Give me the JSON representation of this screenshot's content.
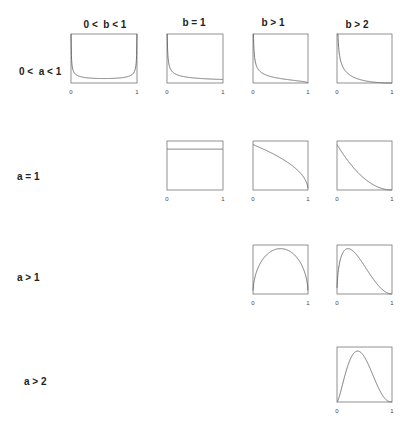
{
  "chart_data": {
    "type": "line",
    "title": "",
    "column_headers": [
      "0 <  b < 1",
      "b = 1",
      "b > 1",
      "b > 2"
    ],
    "row_headers": [
      "0 <  a < 1",
      "a = 1",
      "a > 1",
      "a > 2"
    ],
    "x_tick_labels": [
      "0",
      "1"
    ],
    "xlim": [
      0,
      1
    ],
    "grid": false,
    "panels": [
      {
        "row": 0,
        "col": 0,
        "a": 0.5,
        "b": 0.5,
        "shape": "U-shaped"
      },
      {
        "row": 0,
        "col": 1,
        "a": 0.5,
        "b": 1,
        "shape": "decreasing, asymptote at 0"
      },
      {
        "row": 0,
        "col": 2,
        "a": 0.5,
        "b": 1.5,
        "shape": "decreasing to 0"
      },
      {
        "row": 0,
        "col": 3,
        "a": 0.5,
        "b": 3,
        "shape": "decreasing, fast decay"
      },
      {
        "row": 1,
        "col": 1,
        "a": 1,
        "b": 1,
        "shape": "uniform"
      },
      {
        "row": 1,
        "col": 2,
        "a": 1,
        "b": 1.5,
        "shape": "concave decreasing"
      },
      {
        "row": 1,
        "col": 3,
        "a": 1,
        "b": 3,
        "shape": "convex decreasing"
      },
      {
        "row": 2,
        "col": 2,
        "a": 1.5,
        "b": 1.5,
        "shape": "symmetric arch"
      },
      {
        "row": 2,
        "col": 3,
        "a": 1.5,
        "b": 3,
        "shape": "right-skewed arch"
      },
      {
        "row": 3,
        "col": 3,
        "a": 2.5,
        "b": 3.5,
        "shape": "unimodal, slightly right-skewed"
      }
    ]
  }
}
